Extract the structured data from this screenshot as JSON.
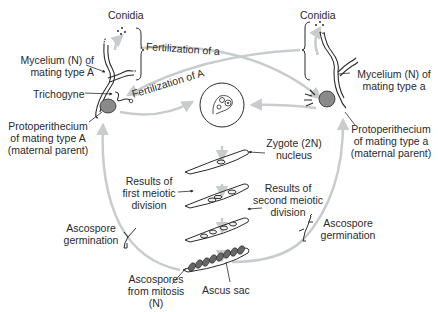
{
  "diagram": {
    "type": "life-cycle",
    "colors": {
      "ink": "#2a2a2a",
      "arrow": "#c8ccce",
      "fill_dark": "#555555"
    },
    "left_parent": {
      "conidia": "Conidia",
      "mycelium_line1": "Mycelium (N) of",
      "mycelium_line2": "mating type A",
      "trichogyne": "Trichogyne",
      "proto_line1": "Protoperithecium",
      "proto_line2": "of mating type A",
      "proto_line3": "(maternal parent)"
    },
    "right_parent": {
      "conidia": "Conidia",
      "mycelium_line1": "Mycelium (N) of",
      "mycelium_line2": "mating type a",
      "proto_line1": "Protoperithecium",
      "proto_line2": "of mating type a",
      "proto_line3": "(maternal parent)"
    },
    "arrows": {
      "fert_a": "Fertilization of a",
      "fert_A": "Fertilization of A"
    },
    "stages": {
      "zygote_line1": "Zygote (2N)",
      "zygote_line2": "nucleus",
      "first_line1": "Results of",
      "first_line2": "first meiotic",
      "first_line3": "division",
      "second_line1": "Results of",
      "second_line2": "second meiotic",
      "second_line3": "division",
      "ascospores_line1": "Ascospores",
      "ascospores_line2": "from mitosis",
      "ascospores_line3": "(N)",
      "ascus_sac": "Ascus sac",
      "germ_left_line1": "Ascospore",
      "germ_left_line2": "germination",
      "germ_right_line1": "Ascospore",
      "germ_right_line2": "germination"
    }
  }
}
